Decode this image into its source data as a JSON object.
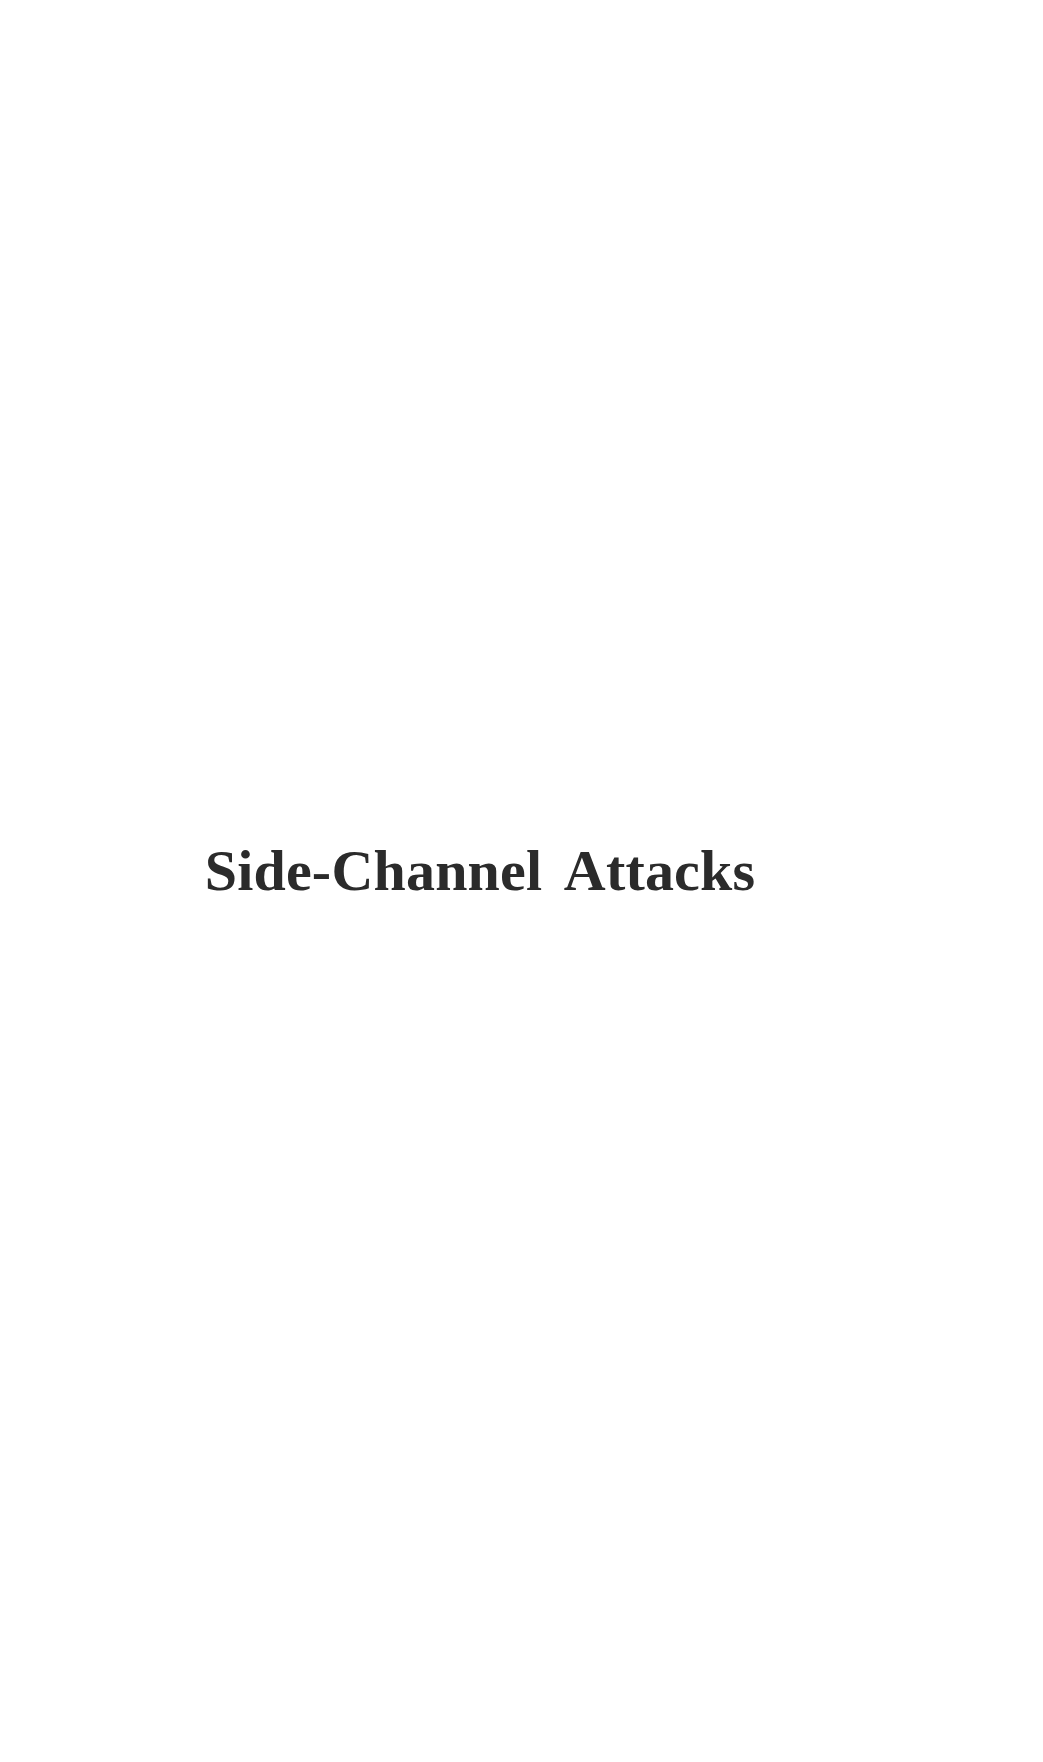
{
  "document": {
    "page_type": "part-title-page",
    "background_color": "#ffffff",
    "text_color": "#2b2b2b",
    "title": "Side-Channel Attacks"
  },
  "page": {
    "title_block": {
      "heading": "Side-Channel Attacks"
    }
  }
}
